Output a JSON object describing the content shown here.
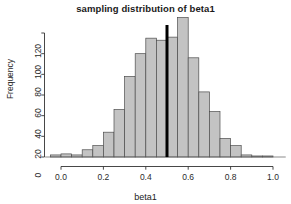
{
  "chart_data": {
    "type": "bar",
    "title": "sampling distribution of beta1",
    "xlabel": "beta1",
    "ylabel": "Frequency",
    "xlim": [
      -0.075,
      1.06
    ],
    "ylim": [
      0,
      138
    ],
    "xticks": [
      0.0,
      0.2,
      0.4,
      0.6,
      0.8,
      1.0
    ],
    "xtick_labels": [
      "0.0",
      "0.2",
      "0.4",
      "0.6",
      "0.8",
      "1.0"
    ],
    "yticks": [
      0,
      20,
      40,
      60,
      80,
      100,
      120
    ],
    "ytick_labels": [
      "0",
      "20",
      "40",
      "60",
      "80",
      "100",
      "120"
    ],
    "grid": false,
    "legend": null,
    "bin_width": 0.05,
    "bin_edges": [
      -0.05,
      0.0,
      0.05,
      0.1,
      0.15,
      0.2,
      0.25,
      0.3,
      0.35,
      0.4,
      0.45,
      0.5,
      0.55,
      0.6,
      0.65,
      0.7,
      0.75,
      0.8,
      0.85,
      0.9,
      0.95,
      1.0
    ],
    "categories": [
      "-0.05",
      "0.00",
      "0.05",
      "0.10",
      "0.15",
      "0.20",
      "0.25",
      "0.30",
      "0.35",
      "0.40",
      "0.45",
      "0.50",
      "0.55",
      "0.60",
      "0.65",
      "0.70",
      "0.75",
      "0.80",
      "0.85",
      "0.90",
      "0.95"
    ],
    "values": [
      2,
      3,
      2,
      7,
      11,
      24,
      46,
      78,
      100,
      115,
      113,
      116,
      135,
      96,
      63,
      44,
      18,
      11,
      2,
      1,
      1
    ],
    "bar_fill": "#c3c3c3",
    "bar_stroke": "#4d4d4d",
    "annotations": [
      {
        "name": "reference-line",
        "type": "vline",
        "x": 0.5,
        "color": "#000000",
        "width": 3
      }
    ]
  }
}
